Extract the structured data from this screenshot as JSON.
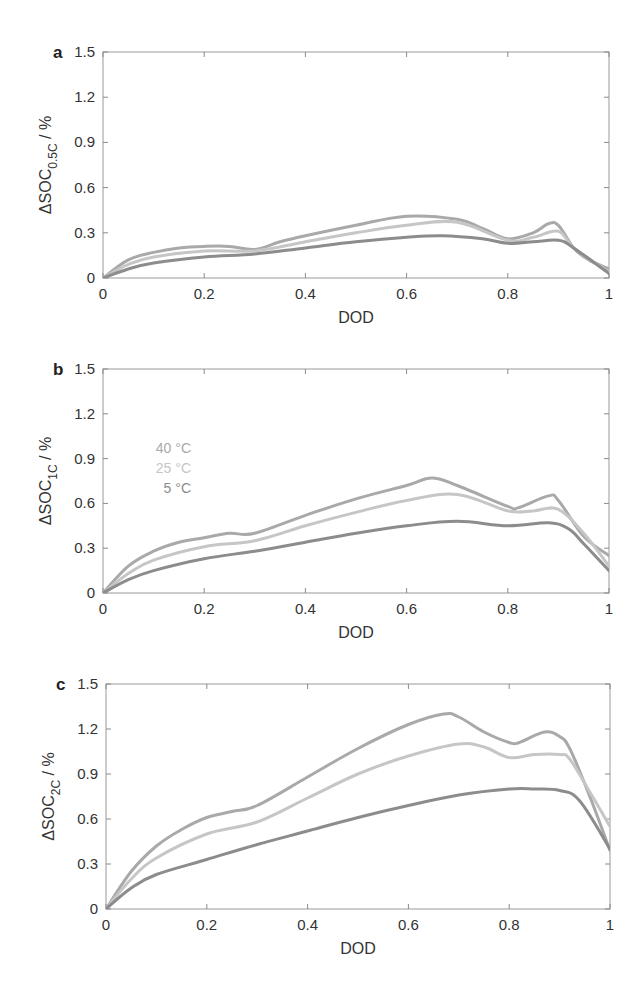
{
  "chart_data": [
    {
      "panel": "a",
      "type": "line",
      "title": "",
      "xlabel": "DOD",
      "ylabel": "ΔSOC",
      "ylabel_sub": "0.5C",
      "ylabel_unit": " / %",
      "xlim": [
        0,
        1
      ],
      "ylim": [
        0,
        1.5
      ],
      "xticks": [
        "0",
        "0.2",
        "0.4",
        "0.6",
        "0.8",
        "1"
      ],
      "yticks": [
        "0",
        "0.3",
        "0.6",
        "0.9",
        "1.2",
        "1.5"
      ],
      "grid": false,
      "series": [
        {
          "name": "40 °C",
          "color": "#a9a9a9",
          "x": [
            0,
            0.05,
            0.1,
            0.15,
            0.2,
            0.25,
            0.3,
            0.35,
            0.4,
            0.5,
            0.6,
            0.7,
            0.75,
            0.8,
            0.85,
            0.88,
            0.9,
            0.93,
            0.96,
            1
          ],
          "y": [
            0,
            0.12,
            0.17,
            0.2,
            0.21,
            0.21,
            0.19,
            0.24,
            0.28,
            0.35,
            0.41,
            0.39,
            0.33,
            0.26,
            0.3,
            0.36,
            0.35,
            0.2,
            0.12,
            0.06
          ]
        },
        {
          "name": "25 °C",
          "color": "#c6c6c6",
          "x": [
            0,
            0.05,
            0.1,
            0.2,
            0.3,
            0.4,
            0.5,
            0.6,
            0.7,
            0.8,
            0.85,
            0.9,
            0.93,
            1
          ],
          "y": [
            0,
            0.09,
            0.14,
            0.18,
            0.18,
            0.24,
            0.3,
            0.35,
            0.37,
            0.25,
            0.27,
            0.31,
            0.2,
            0.04
          ]
        },
        {
          "name": "5 °C",
          "color": "#8c8c8c",
          "x": [
            0,
            0.05,
            0.1,
            0.2,
            0.3,
            0.4,
            0.5,
            0.6,
            0.67,
            0.75,
            0.8,
            0.85,
            0.9,
            0.93,
            1
          ],
          "y": [
            0,
            0.06,
            0.1,
            0.14,
            0.16,
            0.2,
            0.24,
            0.27,
            0.28,
            0.26,
            0.23,
            0.24,
            0.25,
            0.2,
            0.03
          ]
        }
      ]
    },
    {
      "panel": "b",
      "type": "line",
      "title": "",
      "xlabel": "DOD",
      "ylabel": "ΔSOC",
      "ylabel_sub": "1C",
      "ylabel_unit": " / %",
      "xlim": [
        0,
        1
      ],
      "ylim": [
        0,
        1.5
      ],
      "xticks": [
        "0",
        "0.2",
        "0.4",
        "0.6",
        "0.8",
        "1"
      ],
      "yticks": [
        "0",
        "0.3",
        "0.6",
        "0.9",
        "1.2",
        "1.5"
      ],
      "grid": false,
      "legend": {
        "position": "upper-left",
        "entries": [
          "40 °C",
          "25 °C",
          "5 °C"
        ]
      },
      "series": [
        {
          "name": "40 °C",
          "color": "#a9a9a9",
          "x": [
            0,
            0.05,
            0.1,
            0.15,
            0.2,
            0.25,
            0.3,
            0.4,
            0.5,
            0.6,
            0.65,
            0.7,
            0.8,
            0.82,
            0.88,
            0.9,
            0.95,
            1
          ],
          "y": [
            0,
            0.18,
            0.28,
            0.34,
            0.37,
            0.4,
            0.4,
            0.52,
            0.63,
            0.72,
            0.77,
            0.72,
            0.58,
            0.57,
            0.65,
            0.62,
            0.38,
            0.25
          ]
        },
        {
          "name": "25 °C",
          "color": "#c6c6c6",
          "x": [
            0,
            0.05,
            0.1,
            0.2,
            0.3,
            0.4,
            0.5,
            0.6,
            0.7,
            0.8,
            0.85,
            0.9,
            0.95,
            1
          ],
          "y": [
            0,
            0.13,
            0.22,
            0.31,
            0.35,
            0.45,
            0.54,
            0.62,
            0.66,
            0.55,
            0.55,
            0.56,
            0.4,
            0.18
          ]
        },
        {
          "name": "5 °C",
          "color": "#8c8c8c",
          "x": [
            0,
            0.05,
            0.1,
            0.2,
            0.3,
            0.4,
            0.5,
            0.6,
            0.7,
            0.8,
            0.88,
            0.92,
            0.95,
            1
          ],
          "y": [
            0,
            0.09,
            0.15,
            0.23,
            0.28,
            0.34,
            0.4,
            0.45,
            0.48,
            0.45,
            0.47,
            0.43,
            0.33,
            0.15
          ]
        }
      ]
    },
    {
      "panel": "c",
      "type": "line",
      "title": "",
      "xlabel": "DOD",
      "ylabel": "ΔSOC",
      "ylabel_sub": "2C",
      "ylabel_unit": " / %",
      "xlim": [
        0,
        1
      ],
      "ylim": [
        0,
        1.5
      ],
      "xticks": [
        "0",
        "0.2",
        "0.4",
        "0.6",
        "0.8",
        "1"
      ],
      "yticks": [
        "0",
        "0.3",
        "0.6",
        "0.9",
        "1.2",
        "1.5"
      ],
      "grid": false,
      "series": [
        {
          "name": "40 °C",
          "color": "#a9a9a9",
          "x": [
            0,
            0.05,
            0.1,
            0.15,
            0.2,
            0.25,
            0.3,
            0.4,
            0.5,
            0.6,
            0.67,
            0.7,
            0.75,
            0.8,
            0.82,
            0.87,
            0.9,
            0.92,
            0.96,
            1
          ],
          "y": [
            0,
            0.25,
            0.42,
            0.53,
            0.61,
            0.65,
            0.69,
            0.88,
            1.07,
            1.23,
            1.3,
            1.28,
            1.18,
            1.11,
            1.11,
            1.18,
            1.15,
            1.07,
            0.75,
            0.39
          ]
        },
        {
          "name": "25 °C",
          "color": "#c6c6c6",
          "x": [
            0,
            0.05,
            0.1,
            0.2,
            0.3,
            0.4,
            0.5,
            0.6,
            0.7,
            0.75,
            0.8,
            0.85,
            0.9,
            0.92,
            0.96,
            1
          ],
          "y": [
            0,
            0.2,
            0.34,
            0.5,
            0.58,
            0.74,
            0.9,
            1.02,
            1.1,
            1.08,
            1.01,
            1.03,
            1.03,
            1.0,
            0.78,
            0.55
          ]
        },
        {
          "name": "5 °C",
          "color": "#8c8c8c",
          "x": [
            0,
            0.05,
            0.1,
            0.2,
            0.3,
            0.4,
            0.5,
            0.6,
            0.7,
            0.8,
            0.85,
            0.9,
            0.94,
            1
          ],
          "y": [
            0,
            0.14,
            0.23,
            0.33,
            0.43,
            0.52,
            0.61,
            0.69,
            0.76,
            0.8,
            0.8,
            0.79,
            0.72,
            0.4
          ]
        }
      ]
    }
  ],
  "layout": {
    "panels": [
      {
        "x0": 103,
        "x1": 609,
        "y0": 52,
        "y1": 278
      },
      {
        "x0": 103,
        "x1": 609,
        "y0": 369,
        "y1": 593
      },
      {
        "x0": 106,
        "x1": 610,
        "y0": 684,
        "y1": 909
      }
    ]
  }
}
